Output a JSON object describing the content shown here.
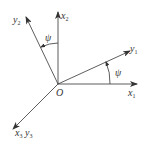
{
  "diagram": {
    "type": "coordinate-frame-rotation",
    "colors": {
      "line": "#333333",
      "background": "#ffffff"
    },
    "origin": {
      "label": "O",
      "x": 58,
      "y": 84
    },
    "axes": [
      {
        "id": "x1",
        "label": "x",
        "sub": "1",
        "end": [
          137,
          84
        ]
      },
      {
        "id": "x2",
        "label": "x",
        "sub": "2",
        "end": [
          58,
          12
        ]
      },
      {
        "id": "y1",
        "label": "y",
        "sub": "1",
        "end": [
          130,
          51
        ]
      },
      {
        "id": "y2",
        "label": "y",
        "sub": "2",
        "end": [
          26,
          17
        ]
      },
      {
        "id": "x3y3",
        "label": "x",
        "sub": "3",
        "label2": "y",
        "sub2": "3",
        "end": [
          13,
          129
        ]
      }
    ],
    "angles": [
      {
        "id": "psi-upper",
        "label": "ψ",
        "between": [
          "x2",
          "y2"
        ]
      },
      {
        "id": "psi-lower",
        "label": "ψ",
        "between": [
          "x1",
          "y1"
        ]
      }
    ]
  }
}
